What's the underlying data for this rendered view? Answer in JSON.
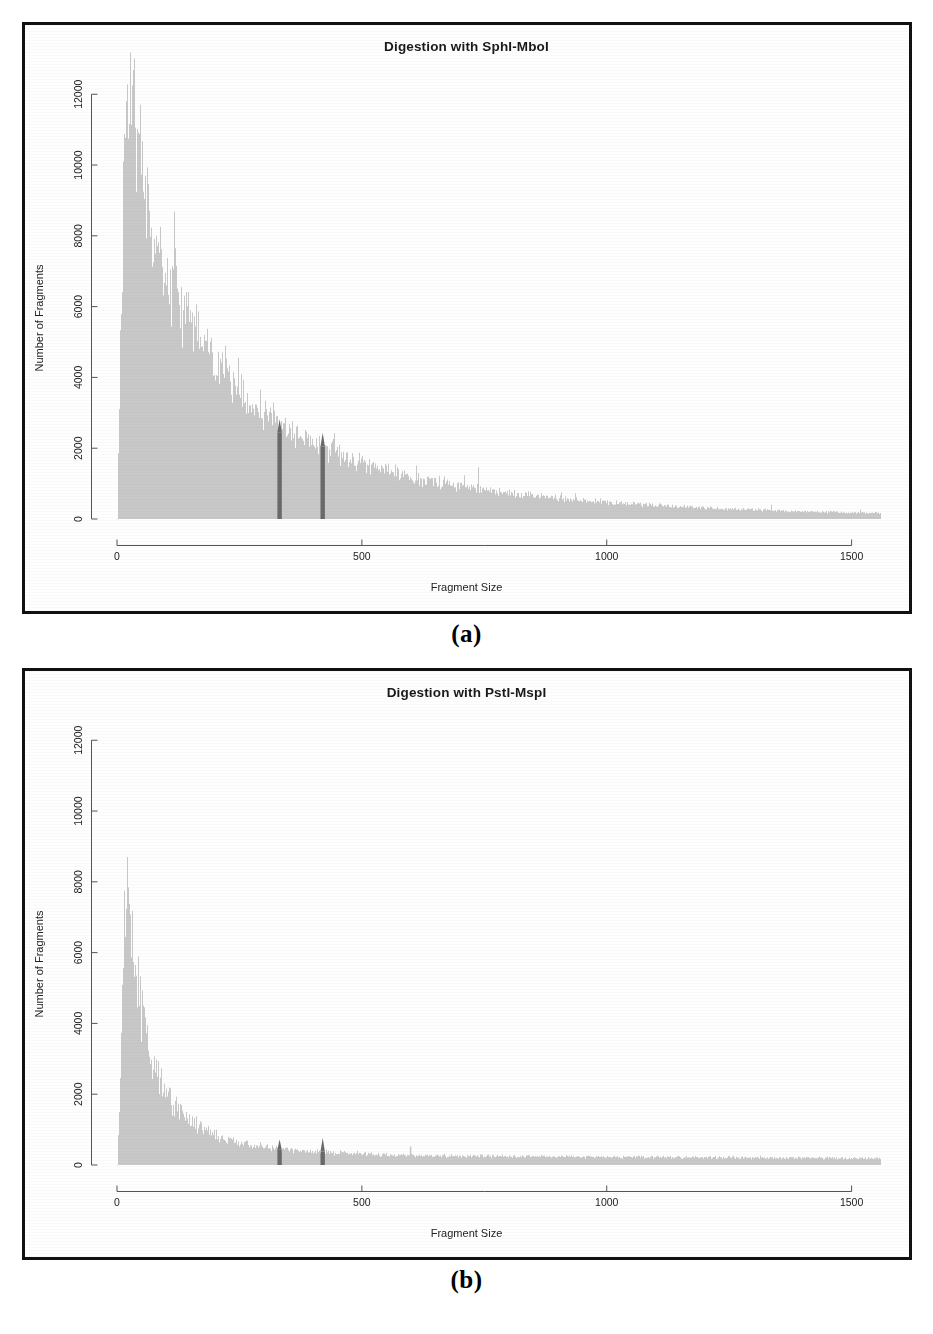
{
  "figure": {
    "panels": [
      {
        "caption": "(a)",
        "title": "Digestion with SphI-MboI",
        "canvas_name": "histogram-canvas-a"
      },
      {
        "caption": "(b)",
        "title": "Digestion with PstI-MspI",
        "canvas_name": "histogram-canvas-b"
      }
    ]
  },
  "style": {
    "bar_color": "#c8c8c8",
    "highlight_color": "#6a6a6a",
    "axis_color": "#555555",
    "frame_color": "#111111",
    "background": "#fefefe"
  },
  "chart_data": [
    {
      "type": "bar",
      "title": "Digestion with SphI-MboI",
      "xlabel": "Fragment Size",
      "ylabel": "Number of Fragments",
      "xlim": [
        0,
        1560
      ],
      "ylim": [
        0,
        12600
      ],
      "xticks": [
        0,
        500,
        1000,
        1500
      ],
      "xticklabels": [
        "0",
        "500",
        "1000",
        "1500"
      ],
      "yticks": [
        0,
        2000,
        4000,
        6000,
        8000,
        10000,
        12000
      ],
      "yticklabels": [
        "0",
        "2000",
        "4000",
        "6000",
        "8000",
        "10000",
        "12000"
      ],
      "grid": false,
      "legend": false,
      "bin_width": 1,
      "noise_amplitude": 0.13,
      "seed": 1737,
      "highlight_bands": [
        {
          "center": 332,
          "width": 9,
          "height": 2450,
          "label": "size-selection-lower"
        },
        {
          "center": 420,
          "width": 9,
          "height": 2050,
          "label": "size-selection-upper"
        }
      ],
      "envelope": {
        "x": [
          8,
          15,
          22,
          28,
          34,
          40,
          48,
          56,
          66,
          78,
          92,
          108,
          126,
          146,
          168,
          192,
          218,
          246,
          276,
          308,
          342,
          378,
          416,
          456,
          498,
          542,
          588,
          636,
          686,
          738,
          792,
          848,
          906,
          966,
          1028,
          1092,
          1158,
          1226,
          1296,
          1368,
          1442,
          1500,
          1555
        ],
        "y": [
          6200,
          10400,
          12050,
          11750,
          11300,
          10800,
          10100,
          9400,
          8700,
          8050,
          7400,
          6800,
          6200,
          5650,
          5100,
          4600,
          4150,
          3700,
          3300,
          2950,
          2600,
          2300,
          2030,
          1800,
          1580,
          1400,
          1240,
          1090,
          960,
          850,
          750,
          660,
          580,
          510,
          450,
          395,
          345,
          300,
          262,
          228,
          198,
          180,
          168
        ]
      }
    },
    {
      "type": "bar",
      "title": "Digestion with PstI-MspI",
      "xlabel": "Fragment Size",
      "ylabel": "Number of Fragments",
      "xlim": [
        0,
        1560
      ],
      "ylim": [
        0,
        12600
      ],
      "xticks": [
        0,
        500,
        1000,
        1500
      ],
      "xticklabels": [
        "0",
        "500",
        "1000",
        "1500"
      ],
      "yticks": [
        0,
        2000,
        4000,
        6000,
        8000,
        10000,
        12000
      ],
      "yticklabels": [
        "0",
        "2000",
        "4000",
        "6000",
        "8000",
        "10000",
        "12000"
      ],
      "grid": false,
      "legend": false,
      "bin_width": 1,
      "noise_amplitude": 0.16,
      "seed": 904,
      "highlight_bands": [
        {
          "center": 332,
          "width": 9,
          "height": 430,
          "label": "size-selection-lower"
        },
        {
          "center": 420,
          "width": 9,
          "height": 380,
          "label": "size-selection-upper"
        }
      ],
      "envelope": {
        "x": [
          8,
          14,
          20,
          26,
          32,
          38,
          46,
          54,
          64,
          76,
          90,
          106,
          124,
          144,
          166,
          190,
          216,
          244,
          274,
          306,
          340,
          376,
          414,
          454,
          496,
          540,
          586,
          634,
          684,
          736,
          790,
          846,
          904,
          964,
          1026,
          1090,
          1156,
          1224,
          1294,
          1366,
          1440,
          1500,
          1555
        ],
        "y": [
          3100,
          6400,
          8050,
          7400,
          6500,
          5700,
          4800,
          4050,
          3350,
          2750,
          2250,
          1850,
          1530,
          1280,
          1070,
          900,
          770,
          660,
          575,
          505,
          450,
          405,
          368,
          338,
          315,
          296,
          282,
          270,
          260,
          252,
          245,
          240,
          234,
          230,
          226,
          222,
          218,
          214,
          210,
          206,
          200,
          196,
          192
        ]
      },
      "spikes": [
        {
          "x": 598,
          "height": 520
        }
      ]
    }
  ]
}
